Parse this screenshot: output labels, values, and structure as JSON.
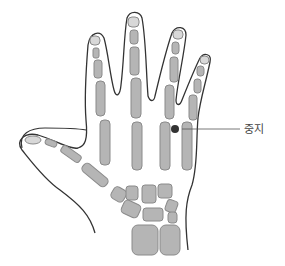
{
  "diagram": {
    "type": "anatomical-illustration",
    "marker": {
      "label": "중지",
      "position": "between 3rd and 4th metacarpal heads",
      "color": "#333333"
    },
    "colors": {
      "bone_fill": "#b5b5b5",
      "bone_stroke": "#8a8a8a",
      "outline": "#333333",
      "background": "#ffffff"
    }
  }
}
